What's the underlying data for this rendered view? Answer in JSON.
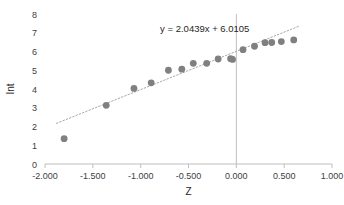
{
  "chart_data": {
    "type": "scatter",
    "title": "",
    "xlabel": "Z",
    "ylabel": "Int",
    "xlim": [
      -2.0,
      1.0
    ],
    "ylim": [
      0,
      8
    ],
    "xticks": [
      -2.0,
      -1.5,
      -1.0,
      -0.5,
      0.0,
      0.5,
      1.0
    ],
    "xtick_labels": [
      "-2.000",
      "-1.500",
      "-1.000",
      "-0.500",
      "0.000",
      "0.500",
      "1.000"
    ],
    "yticks": [
      0,
      1,
      2,
      3,
      4,
      5,
      6,
      7,
      8
    ],
    "ytick_labels": [
      "0",
      "1",
      "2",
      "3",
      "4",
      "5",
      "6",
      "7",
      "8"
    ],
    "grid": false,
    "legend": false,
    "marker_color": "#808080",
    "trendline_color": "#a6a6a6",
    "trendline_style": "dotted",
    "axis_color": "#bfbfbf",
    "series": [
      {
        "name": "Int vs Z",
        "points": [
          [
            -1.8,
            1.35
          ],
          [
            -1.36,
            3.13
          ],
          [
            -1.07,
            4.03
          ],
          [
            -0.89,
            4.33
          ],
          [
            -0.71,
            5.0
          ],
          [
            -0.57,
            5.06
          ],
          [
            -0.45,
            5.37
          ],
          [
            -0.31,
            5.37
          ],
          [
            -0.19,
            5.6
          ],
          [
            -0.06,
            5.62
          ],
          [
            -0.04,
            5.58
          ],
          [
            0.07,
            6.1
          ],
          [
            0.19,
            6.28
          ],
          [
            0.3,
            6.47
          ],
          [
            0.37,
            6.48
          ],
          [
            0.47,
            6.53
          ],
          [
            0.6,
            6.62
          ]
        ]
      }
    ],
    "annotations": [
      {
        "name": "trendline-equation",
        "text": "y = 2.0439x + 6.0105",
        "x": -0.33,
        "y": 7.05
      }
    ],
    "trendline": {
      "slope": 2.0439,
      "intercept": 6.0105,
      "x_start": -1.88,
      "x_end": 0.66
    }
  }
}
